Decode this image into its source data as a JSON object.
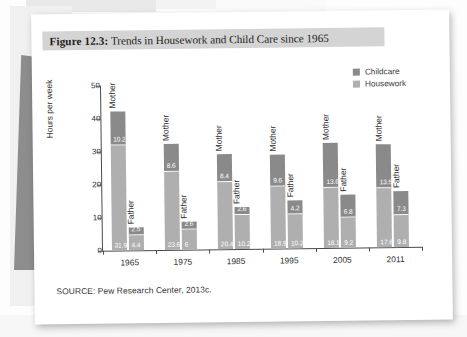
{
  "figure": {
    "title_prefix": "Figure 12.3:",
    "title_rest": " Trends in Housework and Child Care since 1965",
    "source": "SOURCE: Pew Research Center, 2013c."
  },
  "colors": {
    "childcare": "#8a8a8a",
    "housework": "#afafaf",
    "axis": "#4a4a4a",
    "title_banner": "#d4d4d4",
    "page": "#ffffff"
  },
  "legend": {
    "items": [
      {
        "label": "Childcare",
        "color": "#8a8a8a"
      },
      {
        "label": "Housework",
        "color": "#afafaf"
      }
    ]
  },
  "chart_data": {
    "type": "bar",
    "title": "Figure 12.3: Trends in Housework and Child Care since 1965",
    "xlabel": "",
    "ylabel": "Hours per week",
    "ylim": [
      0,
      50
    ],
    "yticks": [
      0,
      10,
      20,
      30,
      40,
      50
    ],
    "grid": false,
    "legend_position": "top-right",
    "stacked": true,
    "categories": [
      "1965",
      "1975",
      "1985",
      "1995",
      "2005",
      "2011"
    ],
    "subgroups": [
      "Mother",
      "Father"
    ],
    "series": [
      {
        "name": "Housework",
        "color": "#afafaf",
        "values": {
          "Mother": [
            31.9,
            23.6,
            20.4,
            18.9,
            18.1,
            17.8
          ],
          "Father": [
            4.4,
            6,
            10.2,
            10.2,
            9.2,
            9.8
          ]
        }
      },
      {
        "name": "Childcare",
        "color": "#8a8a8a",
        "values": {
          "Mother": [
            10.2,
            8.6,
            8.4,
            9.6,
            13.6,
            13.5
          ],
          "Father": [
            2.5,
            2.6,
            2.6,
            4.2,
            6.8,
            7.3
          ]
        }
      }
    ],
    "groups": [
      {
        "year": "1965",
        "bars": [
          {
            "name": "Mother",
            "childcare": 10.2,
            "housework": 31.9,
            "total": 42.1
          },
          {
            "name": "Father",
            "childcare": 2.5,
            "housework": 4.4,
            "total": 6.9
          }
        ]
      },
      {
        "year": "1975",
        "bars": [
          {
            "name": "Mother",
            "childcare": 8.6,
            "housework": 23.6,
            "total": 32.2
          },
          {
            "name": "Father",
            "childcare": 2.6,
            "housework": 6,
            "total": 8.6
          }
        ]
      },
      {
        "year": "1985",
        "bars": [
          {
            "name": "Mother",
            "childcare": 8.4,
            "housework": 20.4,
            "total": 28.8
          },
          {
            "name": "Father",
            "childcare": 2.6,
            "housework": 10.2,
            "total": 12.8
          }
        ]
      },
      {
        "year": "1995",
        "bars": [
          {
            "name": "Mother",
            "childcare": 9.6,
            "housework": 18.9,
            "total": 28.5
          },
          {
            "name": "Father",
            "childcare": 4.2,
            "housework": 10.2,
            "total": 14.4
          }
        ]
      },
      {
        "year": "2005",
        "bars": [
          {
            "name": "Mother",
            "childcare": 13.6,
            "housework": 18.1,
            "total": 31.7
          },
          {
            "name": "Father",
            "childcare": 6.8,
            "housework": 9.2,
            "total": 16.0
          }
        ]
      },
      {
        "year": "2011",
        "bars": [
          {
            "name": "Mother",
            "childcare": 13.5,
            "housework": 17.8,
            "total": 31.3
          },
          {
            "name": "Father",
            "childcare": 7.3,
            "housework": 9.8,
            "total": 17.1
          }
        ]
      }
    ]
  }
}
